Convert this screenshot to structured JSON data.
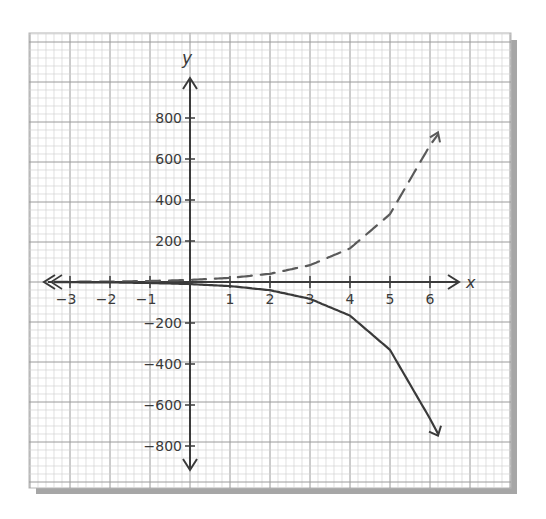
{
  "chart_data": {
    "type": "line",
    "title": "",
    "xlabel": "x",
    "ylabel": "y",
    "xlim": [
      -3.5,
      7.0
    ],
    "ylim": [
      -900,
      950
    ],
    "grid": true,
    "x_ticks": [
      -3,
      -2,
      -1,
      1,
      2,
      3,
      4,
      5,
      6
    ],
    "x_tick_labels": [
      "−3",
      "−2",
      "−1",
      "1",
      "2",
      "3",
      "4",
      "5",
      "6"
    ],
    "y_ticks": [
      800,
      600,
      400,
      200,
      -200,
      -400,
      -600,
      -800
    ],
    "y_tick_labels": [
      "800",
      "600",
      "400",
      "200",
      "−200",
      "−400",
      "−600",
      "−800"
    ],
    "series": [
      {
        "name": "dashed curve (increasing)",
        "style": "dashed",
        "x": [
          -3.4,
          -3,
          -2,
          -1,
          0,
          1,
          2,
          3,
          4,
          5,
          6,
          6.2
        ],
        "y": [
          1,
          1,
          2,
          5,
          10,
          20,
          40,
          82,
          164,
          331,
          667,
          720
        ]
      },
      {
        "name": "solid curve (decreasing)",
        "style": "solid",
        "x": [
          -3.4,
          -3,
          -2,
          -1,
          0,
          1,
          2,
          3,
          4,
          5,
          6,
          6.2
        ],
        "y": [
          -1,
          -1,
          -2,
          -5,
          -10,
          -20,
          -40,
          -82,
          -164,
          -331,
          -667,
          -740
        ]
      }
    ]
  },
  "axis_labels": {
    "x": "x",
    "y": "y"
  },
  "colors": {
    "ink": "#3a3a3a",
    "dashed": "#5a5a5a",
    "grid_major": "#9a9a9a",
    "grid_minor": "#d2d2d2",
    "shadow": "#9e9e9e"
  }
}
